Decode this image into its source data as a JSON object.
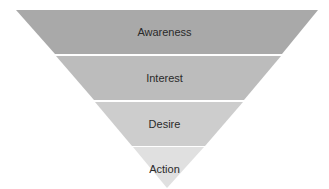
{
  "diagram": {
    "type": "funnel",
    "stages": [
      {
        "label": "Awareness",
        "color": "#a9a9a9"
      },
      {
        "label": "Interest",
        "color": "#bcbcbc"
      },
      {
        "label": "Desire",
        "color": "#cdcdcd"
      },
      {
        "label": "Action",
        "color": "#e0e0e0"
      }
    ],
    "separator_color": "#f4f4f4"
  }
}
